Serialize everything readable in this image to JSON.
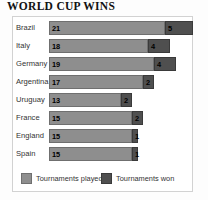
{
  "title": "WORLD CUP WINS",
  "legend": {
    "played_label": "Tournaments played",
    "won_label": "Tournaments won",
    "played_color": "#8e8e8e",
    "won_color": "#4f4f4f"
  },
  "chart_data": {
    "type": "bar",
    "orientation": "horizontal",
    "stacked": true,
    "title": "WORLD CUP WINS",
    "xlabel": "",
    "ylabel": "",
    "grid": false,
    "legend_position": "bottom",
    "categories": [
      "Brazil",
      "Italy",
      "Germany",
      "Argentina",
      "Uruguay",
      "France",
      "England",
      "Spain"
    ],
    "series": [
      {
        "name": "Tournaments played",
        "color": "#8e8e8e",
        "values": [
          21,
          18,
          19,
          17,
          13,
          15,
          15,
          15
        ]
      },
      {
        "name": "Tournaments won",
        "color": "#4f4f4f",
        "values": [
          5,
          4,
          4,
          2,
          2,
          2,
          1,
          1
        ]
      }
    ],
    "xlim": [
      0,
      26
    ],
    "rows": [
      {
        "country": "Brazil",
        "played": 21,
        "won": 5
      },
      {
        "country": "Italy",
        "played": 18,
        "won": 4
      },
      {
        "country": "Germany",
        "played": 19,
        "won": 4
      },
      {
        "country": "Argentina",
        "played": 17,
        "won": 2
      },
      {
        "country": "Uruguay",
        "played": 13,
        "won": 2
      },
      {
        "country": "France",
        "played": 15,
        "won": 2
      },
      {
        "country": "England",
        "played": 15,
        "won": 1
      },
      {
        "country": "Spain",
        "played": 15,
        "won": 1
      }
    ]
  }
}
